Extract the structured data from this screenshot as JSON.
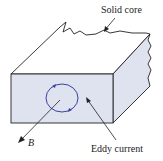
{
  "labels": {
    "solid_core": "Solid core",
    "eddy_current": "Eddy current",
    "b_field": "B"
  },
  "colors": {
    "face_fill": "#dfe3f0",
    "outline": "#222222",
    "eddy_loop": "#3a3fa0"
  }
}
